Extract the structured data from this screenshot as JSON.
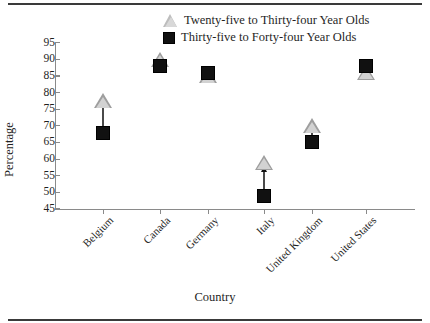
{
  "chart_data": {
    "type": "scatter",
    "title": "",
    "xlabel": "Country",
    "ylabel": "Percentage",
    "ylim": [
      45,
      95
    ],
    "ytick_step": 5,
    "grid": false,
    "legend_position": "top-center",
    "categories": [
      "Belgium",
      "Canada",
      "Germany",
      "Italy",
      "United Kingdom",
      "United States"
    ],
    "yticks": [
      95,
      90,
      85,
      80,
      75,
      70,
      65,
      60,
      55,
      50,
      45
    ],
    "series": [
      {
        "name": "Twenty-five to Thirty-four Year Olds",
        "marker": "triangle",
        "color": "#d2d2d2",
        "values": [
          77.5,
          90,
          85,
          59,
          70,
          86
        ]
      },
      {
        "name": "Thirty-five to Forty-four Year Olds",
        "marker": "square",
        "color": "#111111",
        "values": [
          68,
          88,
          86,
          49,
          65,
          88
        ]
      }
    ],
    "annotations": [
      {
        "category": "Belgium",
        "type": "arrow",
        "from": 68,
        "to": 76
      },
      {
        "category": "Canada",
        "type": "arrow",
        "from": 88,
        "to": 89
      },
      {
        "category": "Italy",
        "type": "arrow",
        "from": 49,
        "to": 56
      },
      {
        "category": "United Kingdom",
        "type": "arrow",
        "from": 65,
        "to": 68
      }
    ]
  },
  "legend": {
    "items": [
      {
        "label": "Twenty-five to Thirty-four Year Olds",
        "marker": "triangle"
      },
      {
        "label": "Thirty-five to Forty-four Year Olds",
        "marker": "square"
      }
    ]
  },
  "axes": {
    "y_title": "Percentage",
    "x_title": "Country",
    "y_ticks": [
      "95",
      "90",
      "85",
      "80",
      "75",
      "70",
      "65",
      "60",
      "55",
      "50",
      "45"
    ],
    "x_ticks": [
      "Belgium",
      "Canada",
      "Germany",
      "Italy",
      "United Kingdom",
      "United States"
    ]
  }
}
